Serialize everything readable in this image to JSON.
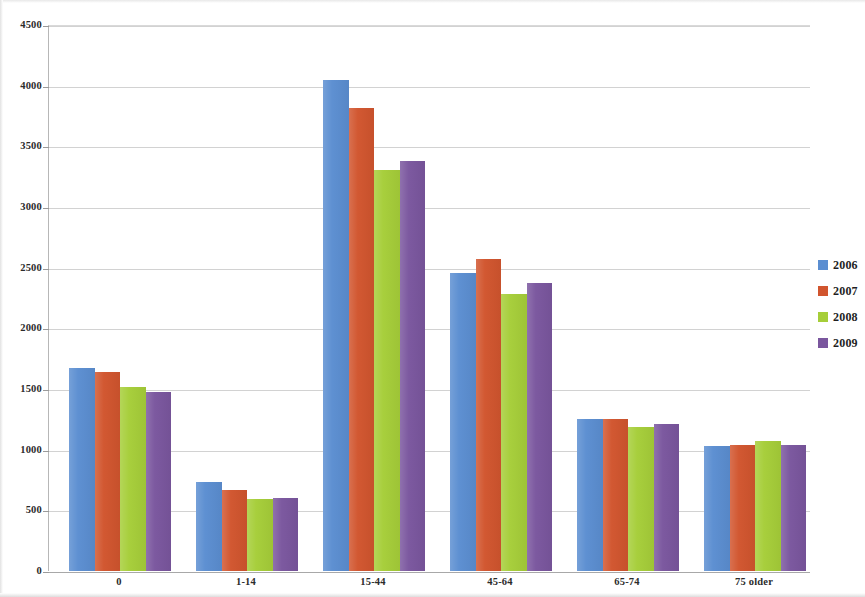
{
  "chart_data": {
    "type": "bar",
    "title": "",
    "subtitle": "",
    "xlabel": "",
    "ylabel": "",
    "categories": [
      "0",
      "1-14",
      "15-44",
      "45-64",
      "65-74",
      "75 older"
    ],
    "series": [
      {
        "name": "2006",
        "color": "#5b8ed1",
        "values": [
          1675,
          730,
          4045,
          2455,
          1255,
          1030
        ]
      },
      {
        "name": "2007",
        "color": "#d1552e",
        "values": [
          1640,
          665,
          3820,
          2570,
          1255,
          1035
        ]
      },
      {
        "name": "2008",
        "color": "#a6ce39",
        "values": [
          1520,
          595,
          3305,
          2280,
          1190,
          1070
        ]
      },
      {
        "name": "2009",
        "color": "#7a569e",
        "values": [
          1475,
          605,
          3380,
          2375,
          1215,
          1035
        ]
      }
    ],
    "ylim": [
      0,
      4500
    ],
    "ytick_step": 500,
    "yticks": [
      0,
      500,
      1000,
      1500,
      2000,
      2500,
      3000,
      3500,
      4000,
      4500
    ],
    "ytick_labels": [
      "0",
      "500",
      "1000",
      "1500",
      "2000",
      "2500",
      "3000",
      "3500",
      "4000",
      "4500"
    ],
    "grid": true,
    "legend_position": "right",
    "legend_entries": [
      "2006",
      "2007",
      "2008",
      "2009"
    ]
  }
}
